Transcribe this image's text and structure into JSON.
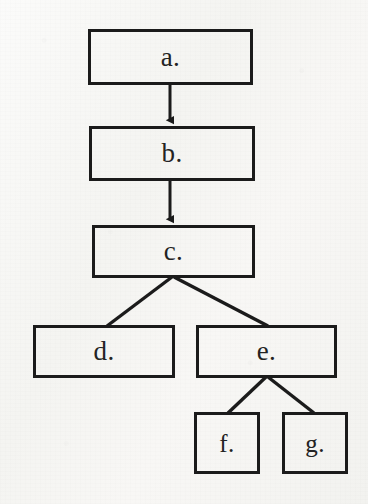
{
  "diagram": {
    "type": "tree",
    "canvas": {
      "width": 368,
      "height": 504
    },
    "colors": {
      "background": "#f7f7f5",
      "stroke": "#1b1b1b",
      "text": "#232323"
    },
    "nodes": [
      {
        "id": "a",
        "label": "a.",
        "x": 88,
        "y": 29,
        "width": 165,
        "height": 56
      },
      {
        "id": "b",
        "label": "b.",
        "x": 89,
        "y": 126,
        "width": 166,
        "height": 55
      },
      {
        "id": "c",
        "label": "c.",
        "x": 92,
        "y": 225,
        "width": 163,
        "height": 53
      },
      {
        "id": "d",
        "label": "d.",
        "x": 33,
        "y": 325,
        "width": 142,
        "height": 53
      },
      {
        "id": "e",
        "label": "e.",
        "x": 196,
        "y": 325,
        "width": 141,
        "height": 53
      },
      {
        "id": "f",
        "label": "f.",
        "x": 194,
        "y": 412,
        "width": 66,
        "height": 62
      },
      {
        "id": "g",
        "label": "g.",
        "x": 282,
        "y": 412,
        "width": 66,
        "height": 62
      }
    ],
    "edges": [
      {
        "from": "a",
        "to": "b",
        "style": "arrow",
        "x1": 170,
        "y1": 85,
        "x2": 170,
        "y2": 126
      },
      {
        "from": "b",
        "to": "c",
        "style": "arrow",
        "x1": 170,
        "y1": 181,
        "x2": 170,
        "y2": 225
      },
      {
        "from": "c",
        "to": "d",
        "style": "line",
        "x1": 172,
        "y1": 278,
        "x2": 107,
        "y2": 325
      },
      {
        "from": "c",
        "to": "e",
        "style": "line",
        "x1": 174,
        "y1": 278,
        "x2": 268,
        "y2": 325
      },
      {
        "from": "e",
        "to": "f",
        "style": "line",
        "x1": 266,
        "y1": 378,
        "x2": 228,
        "y2": 412
      },
      {
        "from": "e",
        "to": "g",
        "style": "line",
        "x1": 268,
        "y1": 378,
        "x2": 314,
        "y2": 412
      }
    ]
  }
}
